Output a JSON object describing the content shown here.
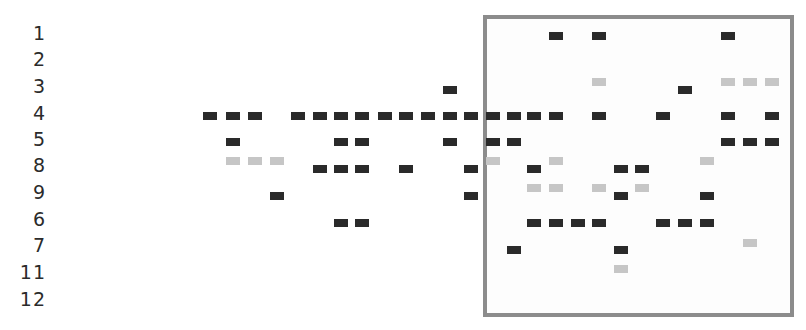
{
  "chart_data": {
    "type": "heatmap",
    "title": "",
    "xlabel": "",
    "ylabel": "",
    "row_labels": [
      "1",
      "2",
      "3",
      "4",
      "5",
      "8",
      "9",
      "6",
      "7",
      "11",
      "12"
    ],
    "row_y": [
      33,
      59,
      86,
      113,
      139,
      165,
      192,
      219,
      245,
      272,
      299
    ],
    "column_x": [
      210,
      233,
      255,
      277,
      298,
      320,
      341,
      362,
      385,
      406,
      428,
      450,
      471,
      493,
      514,
      534,
      556,
      578,
      599,
      621,
      642,
      663,
      685,
      707,
      728,
      750,
      772
    ],
    "legend": [
      {
        "name": "strong",
        "color": "#2a2a2a"
      },
      {
        "name": "weak",
        "color": "#c6c6c6"
      }
    ],
    "highlight_box": {
      "left": 483,
      "top": 15,
      "right": 794,
      "bottom": 317,
      "color": "#8c8c8c"
    },
    "marks": [
      {
        "row": "1",
        "x": 556,
        "y": 36,
        "tone": "dark"
      },
      {
        "row": "1",
        "x": 599,
        "y": 36,
        "tone": "dark"
      },
      {
        "row": "1",
        "x": 728,
        "y": 36,
        "tone": "dark"
      },
      {
        "row": "3",
        "x": 599,
        "y": 82,
        "tone": "light"
      },
      {
        "row": "3",
        "x": 728,
        "y": 82,
        "tone": "light"
      },
      {
        "row": "3",
        "x": 750,
        "y": 82,
        "tone": "light"
      },
      {
        "row": "3",
        "x": 772,
        "y": 82,
        "tone": "light"
      },
      {
        "row": "3",
        "x": 450,
        "y": 90,
        "tone": "dark"
      },
      {
        "row": "3",
        "x": 685,
        "y": 90,
        "tone": "dark"
      },
      {
        "row": "4",
        "x": 210,
        "y": 116,
        "tone": "dark"
      },
      {
        "row": "4",
        "x": 233,
        "y": 116,
        "tone": "dark"
      },
      {
        "row": "4",
        "x": 255,
        "y": 116,
        "tone": "dark"
      },
      {
        "row": "4",
        "x": 298,
        "y": 116,
        "tone": "dark"
      },
      {
        "row": "4",
        "x": 320,
        "y": 116,
        "tone": "dark"
      },
      {
        "row": "4",
        "x": 341,
        "y": 116,
        "tone": "dark"
      },
      {
        "row": "4",
        "x": 362,
        "y": 116,
        "tone": "dark"
      },
      {
        "row": "4",
        "x": 385,
        "y": 116,
        "tone": "dark"
      },
      {
        "row": "4",
        "x": 406,
        "y": 116,
        "tone": "dark"
      },
      {
        "row": "4",
        "x": 428,
        "y": 116,
        "tone": "dark"
      },
      {
        "row": "4",
        "x": 450,
        "y": 116,
        "tone": "dark"
      },
      {
        "row": "4",
        "x": 471,
        "y": 116,
        "tone": "dark"
      },
      {
        "row": "4",
        "x": 493,
        "y": 116,
        "tone": "dark"
      },
      {
        "row": "4",
        "x": 514,
        "y": 116,
        "tone": "dark"
      },
      {
        "row": "4",
        "x": 534,
        "y": 116,
        "tone": "dark"
      },
      {
        "row": "4",
        "x": 556,
        "y": 116,
        "tone": "dark"
      },
      {
        "row": "4",
        "x": 599,
        "y": 116,
        "tone": "dark"
      },
      {
        "row": "4",
        "x": 663,
        "y": 116,
        "tone": "dark"
      },
      {
        "row": "4",
        "x": 728,
        "y": 116,
        "tone": "dark"
      },
      {
        "row": "4",
        "x": 772,
        "y": 116,
        "tone": "dark"
      },
      {
        "row": "5",
        "x": 233,
        "y": 142,
        "tone": "dark"
      },
      {
        "row": "5",
        "x": 341,
        "y": 142,
        "tone": "dark"
      },
      {
        "row": "5",
        "x": 362,
        "y": 142,
        "tone": "dark"
      },
      {
        "row": "5",
        "x": 450,
        "y": 142,
        "tone": "dark"
      },
      {
        "row": "5",
        "x": 493,
        "y": 142,
        "tone": "dark"
      },
      {
        "row": "5",
        "x": 514,
        "y": 142,
        "tone": "dark"
      },
      {
        "row": "5",
        "x": 728,
        "y": 142,
        "tone": "dark"
      },
      {
        "row": "5",
        "x": 750,
        "y": 142,
        "tone": "dark"
      },
      {
        "row": "5",
        "x": 772,
        "y": 142,
        "tone": "dark"
      },
      {
        "row": "8",
        "x": 233,
        "y": 161,
        "tone": "light"
      },
      {
        "row": "8",
        "x": 255,
        "y": 161,
        "tone": "light"
      },
      {
        "row": "8",
        "x": 277,
        "y": 161,
        "tone": "light"
      },
      {
        "row": "8",
        "x": 493,
        "y": 161,
        "tone": "light"
      },
      {
        "row": "8",
        "x": 556,
        "y": 161,
        "tone": "light"
      },
      {
        "row": "8",
        "x": 707,
        "y": 161,
        "tone": "light"
      },
      {
        "row": "8",
        "x": 320,
        "y": 169,
        "tone": "dark"
      },
      {
        "row": "8",
        "x": 341,
        "y": 169,
        "tone": "dark"
      },
      {
        "row": "8",
        "x": 362,
        "y": 169,
        "tone": "dark"
      },
      {
        "row": "8",
        "x": 406,
        "y": 169,
        "tone": "dark"
      },
      {
        "row": "8",
        "x": 471,
        "y": 169,
        "tone": "dark"
      },
      {
        "row": "8",
        "x": 534,
        "y": 169,
        "tone": "dark"
      },
      {
        "row": "8",
        "x": 621,
        "y": 169,
        "tone": "dark"
      },
      {
        "row": "8",
        "x": 642,
        "y": 169,
        "tone": "dark"
      },
      {
        "row": "9",
        "x": 534,
        "y": 188,
        "tone": "light"
      },
      {
        "row": "9",
        "x": 556,
        "y": 188,
        "tone": "light"
      },
      {
        "row": "9",
        "x": 599,
        "y": 188,
        "tone": "light"
      },
      {
        "row": "9",
        "x": 642,
        "y": 188,
        "tone": "light"
      },
      {
        "row": "9",
        "x": 277,
        "y": 196,
        "tone": "dark"
      },
      {
        "row": "9",
        "x": 471,
        "y": 196,
        "tone": "dark"
      },
      {
        "row": "9",
        "x": 621,
        "y": 196,
        "tone": "dark"
      },
      {
        "row": "9",
        "x": 707,
        "y": 196,
        "tone": "dark"
      },
      {
        "row": "6",
        "x": 341,
        "y": 223,
        "tone": "dark"
      },
      {
        "row": "6",
        "x": 362,
        "y": 223,
        "tone": "dark"
      },
      {
        "row": "6",
        "x": 534,
        "y": 223,
        "tone": "dark"
      },
      {
        "row": "6",
        "x": 556,
        "y": 223,
        "tone": "dark"
      },
      {
        "row": "6",
        "x": 578,
        "y": 223,
        "tone": "dark"
      },
      {
        "row": "6",
        "x": 599,
        "y": 223,
        "tone": "dark"
      },
      {
        "row": "6",
        "x": 663,
        "y": 223,
        "tone": "dark"
      },
      {
        "row": "6",
        "x": 685,
        "y": 223,
        "tone": "dark"
      },
      {
        "row": "6",
        "x": 707,
        "y": 223,
        "tone": "dark"
      },
      {
        "row": "7",
        "x": 750,
        "y": 243,
        "tone": "light"
      },
      {
        "row": "7",
        "x": 514,
        "y": 250,
        "tone": "dark"
      },
      {
        "row": "7",
        "x": 621,
        "y": 250,
        "tone": "dark"
      },
      {
        "row": "11",
        "x": 621,
        "y": 269,
        "tone": "light"
      }
    ]
  }
}
